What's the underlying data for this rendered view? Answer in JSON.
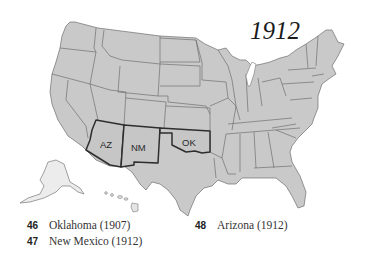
{
  "map": {
    "title": "1912",
    "fill_color": "#c9c9c9",
    "highlight_border_color": "#2e2e2e",
    "highlighted_states": [
      {
        "abbr": "AZ",
        "name": "Arizona"
      },
      {
        "abbr": "NM",
        "name": "New Mexico"
      },
      {
        "abbr": "OK",
        "name": "Oklahoma"
      }
    ]
  },
  "legend": {
    "items": [
      {
        "number": "46",
        "label": "Oklahoma (1907)"
      },
      {
        "number": "47",
        "label": "New Mexico (1912)"
      },
      {
        "number": "48",
        "label": "Arizona (1912)"
      }
    ]
  }
}
